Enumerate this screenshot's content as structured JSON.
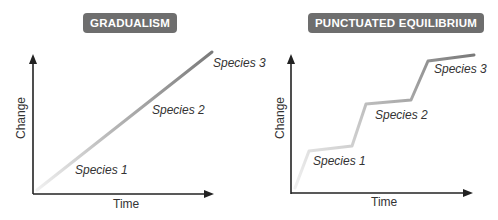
{
  "panels": [
    {
      "title": "GRADUALISM",
      "xlabel": "Time",
      "ylabel": "Change",
      "labels": [
        "Species 1",
        "Species 2",
        "Species 3"
      ]
    },
    {
      "title": "PUNCTUATED EQUILIBRIUM",
      "xlabel": "Time",
      "ylabel": "Change",
      "labels": [
        "Species 1",
        "Species 2",
        "Species 3"
      ]
    }
  ],
  "colors": {
    "badge_bg": "#6e6e6e",
    "badge_text": "#ffffff",
    "axis": "#222222",
    "line_dark": "#7a7a7a",
    "line_light": "#e6e6e6"
  }
}
